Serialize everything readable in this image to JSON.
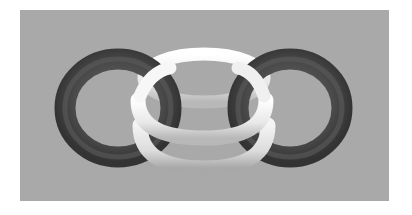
{
  "image": {
    "subject": "three interlocking torus rings",
    "background_color": "#a9a9a9",
    "rings": [
      {
        "name": "left-ring",
        "color": "#4a4a4a"
      },
      {
        "name": "center-ring-top",
        "color": "#f2f2f2"
      },
      {
        "name": "center-ring-bottom",
        "color": "#e6e6e6"
      },
      {
        "name": "right-ring",
        "color": "#4a4a4a"
      }
    ]
  }
}
